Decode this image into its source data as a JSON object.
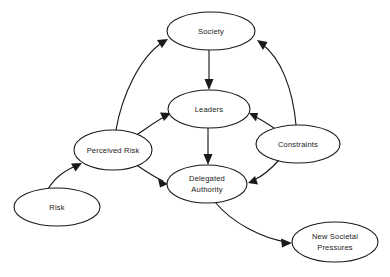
{
  "diagram": {
    "type": "directed-graph",
    "background_color": "#ffffff",
    "stroke_color": "#1a1a1a",
    "text_color": "#1a1a1a",
    "width": 390,
    "height": 277,
    "nodes": [
      {
        "id": "society",
        "label": "Society",
        "lines": [
          "Society"
        ],
        "cx": 211,
        "cy": 31,
        "rx": 44,
        "ry": 19
      },
      {
        "id": "leaders",
        "label": "Leaders",
        "lines": [
          "Leaders"
        ],
        "cx": 209,
        "cy": 109,
        "rx": 41,
        "ry": 19
      },
      {
        "id": "perceived-risk",
        "label": "Perceived Risk",
        "lines": [
          "Perceived Risk"
        ],
        "cx": 113,
        "cy": 150,
        "rx": 39,
        "ry": 20
      },
      {
        "id": "constraints",
        "label": "Constraints",
        "lines": [
          "Constraints"
        ],
        "cx": 298,
        "cy": 144,
        "rx": 42,
        "ry": 19
      },
      {
        "id": "delegated-authority",
        "label": "Delegated Authority",
        "lines": [
          "Delegated",
          "Authority"
        ],
        "cx": 207,
        "cy": 184,
        "rx": 40,
        "ry": 19
      },
      {
        "id": "risk",
        "label": "Risk",
        "lines": [
          "Risk"
        ],
        "cx": 57,
        "cy": 207,
        "rx": 43,
        "ry": 19
      },
      {
        "id": "new-societal-pressures",
        "label": "New Societal Pressures",
        "lines": [
          "New Societal",
          "Pressures"
        ],
        "cx": 335,
        "cy": 242,
        "rx": 43,
        "ry": 20
      }
    ],
    "edges": [
      {
        "id": "risk-to-perceived-risk",
        "from": "Risk",
        "to": "Perceived Risk"
      },
      {
        "id": "perceived-risk-to-society",
        "from": "Perceived Risk",
        "to": "Society"
      },
      {
        "id": "perceived-risk-to-leaders",
        "from": "Perceived Risk",
        "to": "Leaders"
      },
      {
        "id": "perceived-risk-to-delegated-authority",
        "from": "Perceived Risk",
        "to": "Delegated Authority"
      },
      {
        "id": "society-to-leaders",
        "from": "Society",
        "to": "Leaders"
      },
      {
        "id": "leaders-to-delegated-authority",
        "from": "Leaders",
        "to": "Delegated Authority"
      },
      {
        "id": "constraints-to-society",
        "from": "Constraints",
        "to": "Society"
      },
      {
        "id": "constraints-to-leaders",
        "from": "Constraints",
        "to": "Leaders"
      },
      {
        "id": "constraints-to-delegated-authority",
        "from": "Constraints",
        "to": "Delegated Authority"
      },
      {
        "id": "delegated-authority-to-new-societal-pressures",
        "from": "Delegated Authority",
        "to": "New Societal Pressures"
      }
    ]
  }
}
